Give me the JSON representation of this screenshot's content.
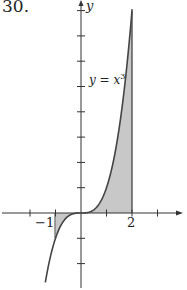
{
  "problem_number": "30.",
  "chart_data": {
    "type": "area",
    "title": "",
    "function_label": "y = x³",
    "function": "y = x^3",
    "xlabel": "",
    "ylabel": "y",
    "shaded_interval": [
      -1,
      2
    ],
    "curve_x_range": [
      -1.4,
      2
    ],
    "xlim": [
      -3,
      4
    ],
    "ylim": [
      -3,
      8.5
    ],
    "x_tick_labels": [
      {
        "x": -1,
        "label": "−1"
      },
      {
        "x": 2,
        "label": "2"
      }
    ],
    "x_ticks": [
      -2,
      -1,
      1,
      2,
      3
    ],
    "y_ticks": [
      -2,
      -1,
      1,
      2,
      3,
      4,
      5,
      6,
      7,
      8
    ],
    "points": [
      {
        "x": -1,
        "y": -1
      },
      {
        "x": 0,
        "y": 0
      },
      {
        "x": 1,
        "y": 1
      },
      {
        "x": 2,
        "y": 8
      }
    ],
    "grid": false,
    "fill_color": "#c8c8c8",
    "line_color": "#444444"
  },
  "labels": {
    "y_axis": "y",
    "curve": "y = x",
    "curve_exp": "3",
    "tick_neg1": "−1",
    "tick_2": "2"
  }
}
